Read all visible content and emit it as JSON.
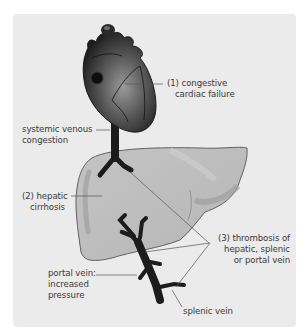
{
  "diagram": {
    "labels": {
      "cardiac_failure": {
        "line1": "(1) congestive",
        "line2": "cardiac failure"
      },
      "systemic_congestion": {
        "line1": "systemic venous",
        "line2": "congestion"
      },
      "cirrhosis": {
        "line1": "(2) hepatic",
        "line2": "cirrhosis"
      },
      "thrombosis": {
        "line1": "(3) thrombosis of",
        "line2": "hepatic, splenic",
        "line3": "or portal vein"
      },
      "portal_vein": {
        "line1": "portal vein:",
        "line2": "increased",
        "line3": "pressure"
      },
      "splenic_vein": {
        "line1": "splenic vein"
      }
    },
    "colors": {
      "background": "#ebebeb",
      "liver_fill": "#bdbdbd",
      "liver_shade": "#a6a6a6",
      "vessel": "#1c1c1c",
      "leader_line": "#555555",
      "text": "#3a3a3a"
    }
  }
}
